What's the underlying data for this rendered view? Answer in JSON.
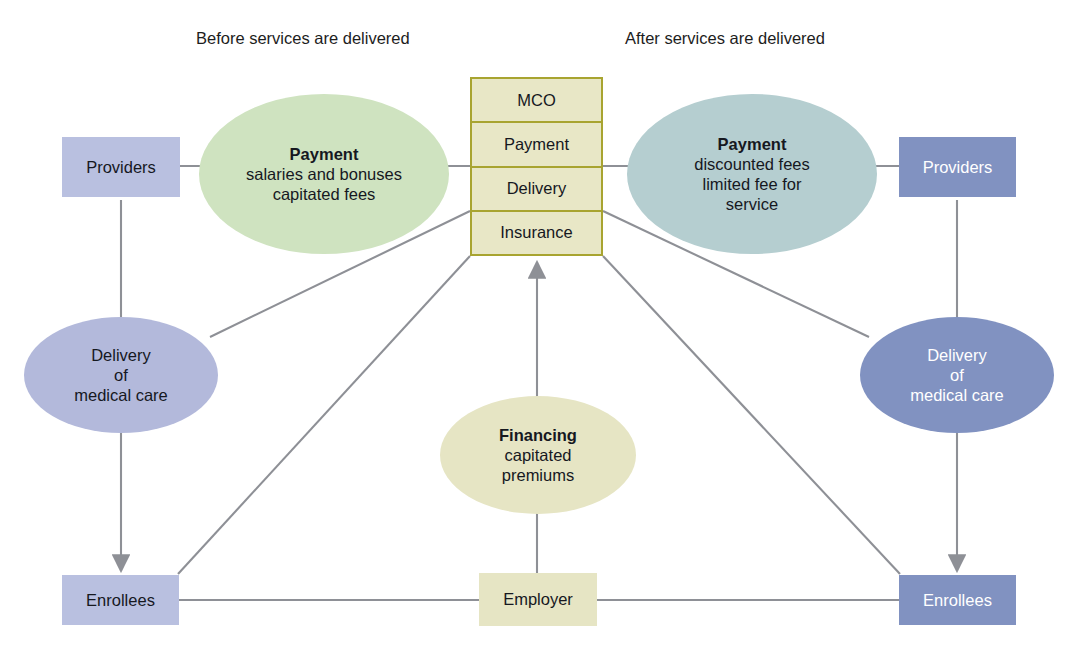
{
  "diagram": {
    "title_left": "Before services are delivered",
    "title_right": "After services are delivered",
    "colors": {
      "light_blue": "#b9c0e0",
      "dark_blue": "#8192c1",
      "cream": "#e6e5c4",
      "green": "#cfe3c0",
      "teal": "#b5ced0",
      "mco_border": "#a8a430",
      "edge": "#8e9096"
    }
  },
  "mco": {
    "cells": [
      {
        "label": "MCO"
      },
      {
        "label": "Payment"
      },
      {
        "label": "Delivery"
      },
      {
        "label": "Insurance"
      }
    ]
  },
  "left": {
    "providers": "Providers",
    "payment_ellipse": {
      "title": "Payment",
      "line1": "salaries and bonuses",
      "line2": "capitated fees"
    },
    "delivery_ellipse": {
      "line1": "Delivery",
      "line2": "of",
      "line3": "medical care"
    },
    "enrollees": "Enrollees"
  },
  "right": {
    "providers": "Providers",
    "payment_ellipse": {
      "title": "Payment",
      "line1": "discounted fees",
      "line2": "limited fee for",
      "line3": "service"
    },
    "delivery_ellipse": {
      "line1": "Delivery",
      "line2": "of",
      "line3": "medical care"
    },
    "enrollees": "Enrollees"
  },
  "center": {
    "financing_ellipse": {
      "title": "Financing",
      "line1": "capitated",
      "line2": "premiums"
    },
    "employer": "Employer"
  }
}
